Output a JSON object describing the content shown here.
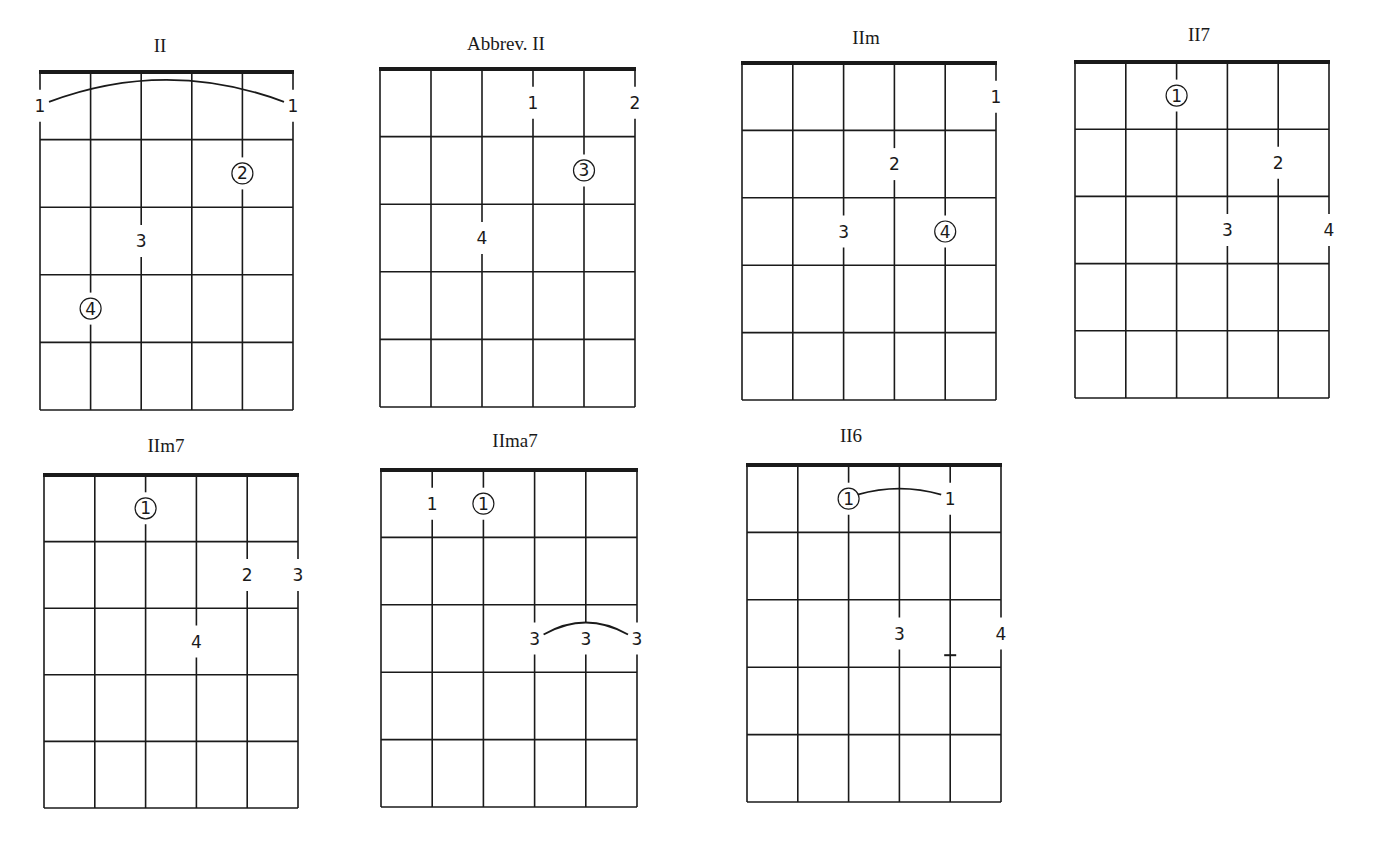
{
  "page": {
    "strings": 6,
    "frets": 5,
    "colors": {
      "ink": "#1a1a1a",
      "paper": "#ffffff"
    }
  },
  "chords": [
    {
      "title": "II",
      "box": {
        "x": 40,
        "y": 72,
        "w": 253,
        "h": 338
      },
      "title_pos": {
        "x": 160,
        "y": 35
      },
      "fingers": [
        {
          "string": 0,
          "fret": 1,
          "label": "1",
          "circled": false
        },
        {
          "string": 5,
          "fret": 1,
          "label": "1",
          "circled": false
        },
        {
          "string": 4,
          "fret": 2,
          "label": "2",
          "circled": true
        },
        {
          "string": 2,
          "fret": 3,
          "label": "3",
          "circled": false
        },
        {
          "string": 1,
          "fret": 4,
          "label": "4",
          "circled": true
        }
      ],
      "arcs": [
        {
          "from_string": 0,
          "to_string": 5,
          "fret": 1,
          "height": 22
        }
      ],
      "marks": []
    },
    {
      "title": "Abbrev. II",
      "box": {
        "x": 380,
        "y": 69,
        "w": 255,
        "h": 338
      },
      "title_pos": {
        "x": 506,
        "y": 33
      },
      "fingers": [
        {
          "string": 3,
          "fret": 1,
          "label": "1",
          "circled": false
        },
        {
          "string": 5,
          "fret": 1,
          "label": "2",
          "circled": false
        },
        {
          "string": 4,
          "fret": 2,
          "label": "3",
          "circled": true
        },
        {
          "string": 2,
          "fret": 3,
          "label": "4",
          "circled": false
        }
      ],
      "arcs": [],
      "marks": []
    },
    {
      "title": "IIm",
      "box": {
        "x": 742,
        "y": 63,
        "w": 254,
        "h": 337
      },
      "title_pos": {
        "x": 866,
        "y": 27
      },
      "fingers": [
        {
          "string": 5,
          "fret": 1,
          "label": "1",
          "circled": false
        },
        {
          "string": 3,
          "fret": 2,
          "label": "2",
          "circled": false
        },
        {
          "string": 2,
          "fret": 3,
          "label": "3",
          "circled": false
        },
        {
          "string": 4,
          "fret": 3,
          "label": "4",
          "circled": true
        }
      ],
      "arcs": [],
      "marks": []
    },
    {
      "title": "II7",
      "box": {
        "x": 1075,
        "y": 62,
        "w": 254,
        "h": 336
      },
      "title_pos": {
        "x": 1199,
        "y": 24
      },
      "fingers": [
        {
          "string": 2,
          "fret": 1,
          "label": "1",
          "circled": true
        },
        {
          "string": 4,
          "fret": 2,
          "label": "2",
          "circled": false
        },
        {
          "string": 3,
          "fret": 3,
          "label": "3",
          "circled": false
        },
        {
          "string": 5,
          "fret": 3,
          "label": "4",
          "circled": false
        }
      ],
      "arcs": [],
      "marks": []
    },
    {
      "title": "IIm7",
      "box": {
        "x": 44,
        "y": 475,
        "w": 254,
        "h": 333
      },
      "title_pos": {
        "x": 166,
        "y": 435
      },
      "fingers": [
        {
          "string": 2,
          "fret": 1,
          "label": "1",
          "circled": true
        },
        {
          "string": 4,
          "fret": 2,
          "label": "2",
          "circled": false
        },
        {
          "string": 5,
          "fret": 2,
          "label": "3",
          "circled": false
        },
        {
          "string": 3,
          "fret": 3,
          "label": "4",
          "circled": false
        }
      ],
      "arcs": [],
      "marks": []
    },
    {
      "title": "IIma7",
      "box": {
        "x": 381,
        "y": 470,
        "w": 256,
        "h": 337
      },
      "title_pos": {
        "x": 515,
        "y": 430
      },
      "fingers": [
        {
          "string": 1,
          "fret": 1,
          "label": "1",
          "circled": false
        },
        {
          "string": 2,
          "fret": 1,
          "label": "1",
          "circled": true
        },
        {
          "string": 3,
          "fret": 3,
          "label": "3",
          "circled": false
        },
        {
          "string": 4,
          "fret": 3,
          "label": "3",
          "circled": false
        },
        {
          "string": 5,
          "fret": 3,
          "label": "3",
          "circled": false
        }
      ],
      "arcs": [
        {
          "from_string": 3,
          "to_string": 5,
          "fret": 3,
          "height": 12
        }
      ],
      "marks": []
    },
    {
      "title": "II6",
      "box": {
        "x": 747,
        "y": 465,
        "w": 254,
        "h": 337
      },
      "title_pos": {
        "x": 851,
        "y": 425
      },
      "fingers": [
        {
          "string": 2,
          "fret": 1,
          "label": "1",
          "circled": true
        },
        {
          "string": 4,
          "fret": 1,
          "label": "1",
          "circled": false
        },
        {
          "string": 3,
          "fret": 3,
          "label": "3",
          "circled": false
        },
        {
          "string": 5,
          "fret": 3,
          "label": "4",
          "circled": false
        }
      ],
      "arcs": [
        {
          "from_string": 2,
          "to_string": 4,
          "fret": 1,
          "height": 6
        }
      ],
      "marks": [
        {
          "string": 4,
          "fret": 3,
          "type": "dash"
        }
      ]
    }
  ]
}
